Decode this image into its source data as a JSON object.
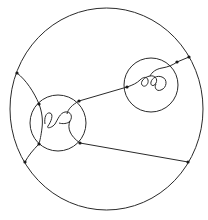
{
  "diagram": {
    "type": "topology-knot-diagram",
    "colors": {
      "line": "#2a2a2a",
      "dot": "#1a1a1a",
      "background": "#ffffff"
    },
    "outer_circle": {
      "cx": 106,
      "cy": 109,
      "r": 98
    },
    "inner_balls": [
      {
        "id": "left-ball",
        "cx": 58,
        "cy": 123,
        "r": 28,
        "contains": "knotted-tangle"
      },
      {
        "id": "right-ball",
        "cx": 151,
        "cy": 85,
        "r": 27,
        "contains": "knotted-tangle"
      }
    ],
    "marked_points": [
      {
        "x": 17,
        "y": 73
      },
      {
        "x": 39,
        "y": 104
      },
      {
        "x": 79,
        "y": 101
      },
      {
        "x": 39,
        "y": 144
      },
      {
        "x": 25,
        "y": 162
      },
      {
        "x": 80,
        "y": 143
      },
      {
        "x": 188,
        "y": 162
      },
      {
        "x": 127,
        "y": 87
      },
      {
        "x": 177,
        "y": 62
      },
      {
        "x": 189,
        "y": 57
      }
    ],
    "labels": []
  }
}
